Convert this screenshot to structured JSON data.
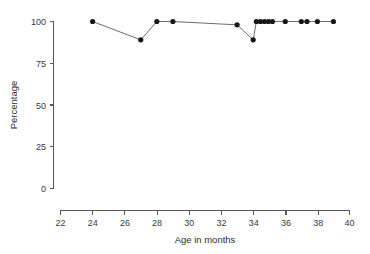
{
  "chart_data": {
    "type": "scatter",
    "title": "",
    "xlabel": "Age in months",
    "ylabel": "Percentage",
    "xlim": [
      22,
      40
    ],
    "ylim": [
      0,
      100
    ],
    "xticks": [
      22,
      24,
      26,
      28,
      30,
      32,
      34,
      36,
      38,
      40
    ],
    "xtick_labels": [
      "22",
      "24",
      "26",
      "28",
      "30",
      "32",
      "34",
      "36",
      "38",
      "40"
    ],
    "yticks": [
      0,
      25,
      50,
      75,
      100
    ],
    "ytick_labels": [
      "0",
      "25",
      "50",
      "75",
      "100"
    ],
    "grid": false,
    "legend": null,
    "marker": "filled-circle",
    "line_style": "solid",
    "series": [
      {
        "name": "percentage",
        "x": [
          24,
          27,
          28,
          29,
          33,
          34,
          34.2,
          34.45,
          34.7,
          34.95,
          35.2,
          36,
          37,
          37.35,
          38,
          39
        ],
        "y": [
          100,
          89,
          100,
          100,
          98,
          89,
          100,
          100,
          100,
          100,
          100,
          100,
          100,
          100,
          100,
          100
        ]
      }
    ]
  },
  "axes": {
    "x_title": "Age in months",
    "y_title": "Percentage"
  }
}
